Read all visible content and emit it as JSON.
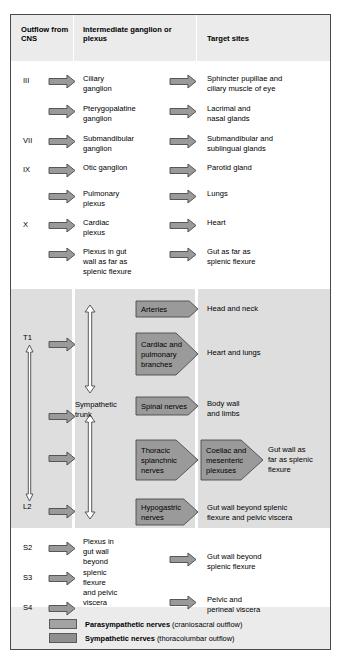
{
  "headers": {
    "col1": "Outflow\nfrom\nCNS",
    "col2": "Intermediate\nganglion\nor plexus",
    "col3": "Target\nsites"
  },
  "colors": {
    "arrow_fill": "#9a9a9a",
    "arrow_stroke": "#4a4a4a",
    "header_band": "#ebebeb",
    "sympathetic_band": "#dedede",
    "legend_band": "#ebebeb",
    "frame_border": "#4a4a4a",
    "page_background": "#ffffff",
    "trunk_arrow_fill": "#ffffff"
  },
  "parasympathetic_rows": [
    {
      "root": "III",
      "ganglion": "Ciliary\nganglion",
      "target": "Sphincter pupillae and\nciliary muscle of eye"
    },
    {
      "root": "",
      "ganglion": "Pterygopalatine\nganglion",
      "target": "Lacrimal and\nnasal glands"
    },
    {
      "root": "VII",
      "ganglion": "Submandibular\nganglion",
      "target": "Submandibular and\nsublingual glands"
    },
    {
      "root": "IX",
      "ganglion": "Otic ganglion",
      "target": "Parotid gland"
    },
    {
      "root": "",
      "ganglion": "Pulmonary\nplexus",
      "target": "Lungs"
    },
    {
      "root": "X",
      "ganglion": "Cardiac\nplexus",
      "target": "Heart"
    },
    {
      "root": "",
      "ganglion": "Plexus in gut\nwall as far as\nsplenic flexure",
      "target": "Gut as far as\nsplenic flexure"
    }
  ],
  "sympathetic": {
    "range_top_label": "T1",
    "range_bottom_label": "L2",
    "trunk_label": "Sympathetic\ntrunk",
    "rows": [
      {
        "nerve": "Arteries",
        "plexus": "",
        "target": "Head and neck"
      },
      {
        "nerve": "Cardiac and\npulmonary\nbranches",
        "plexus": "",
        "target": "Heart and lungs"
      },
      {
        "nerve": "Spinal nerves",
        "plexus": "",
        "target": "Body wall\nand limbs"
      },
      {
        "nerve": "Thoracic\nsplanchnic\nnerves",
        "plexus": "Coeliac and\nmesenteric\nplexuses",
        "target": "Gut wall as\nfar as splenic\nflexure"
      },
      {
        "nerve": "Hypogastric\nnerves",
        "plexus": "",
        "target": "Gut wall beyond splenic\nflexure and pelvic viscera"
      }
    ]
  },
  "sacral": {
    "roots": [
      "S2",
      "S3",
      "S4"
    ],
    "plexus": "Plexus in\ngut wall\nbeyond\nsplenic\nflexure\nand pelvic\nviscera",
    "targets": [
      "Gut wall beyond\nsplenic flexure",
      "Pelvic and\nperineal viscera"
    ]
  },
  "legend": [
    {
      "bold": "Parasympathetic nerves",
      "rest": " (craniosacral outflow)",
      "color": "#a3a3a3"
    },
    {
      "bold": "Sympathetic nerves",
      "rest": " (thoracolumbar outflow)",
      "color": "#8f8f8f"
    }
  ]
}
